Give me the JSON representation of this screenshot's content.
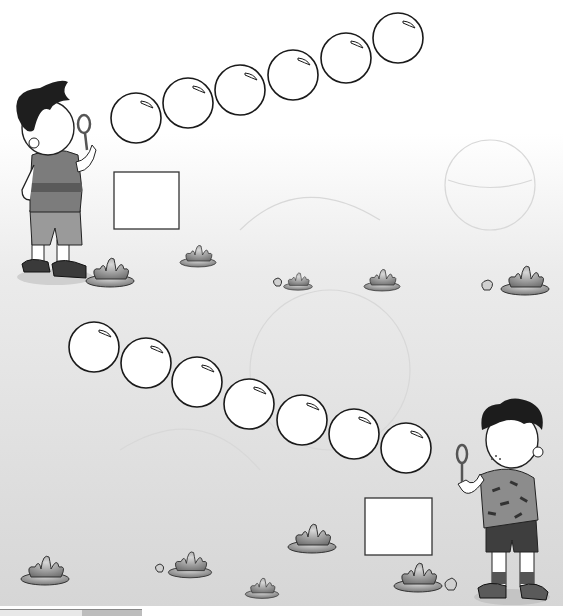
{
  "worksheet": {
    "type": "counting-bubbles-illustration",
    "colors": {
      "background_top": "#ffffff",
      "background_bottom": "#d9d9d9",
      "outline": "#1a1a1a",
      "bubble_fill": "#ffffff",
      "plant_dark": "#6e6e6e",
      "plant_light": "#c8c8c8"
    },
    "top_group": {
      "character": "boy-with-wavy-hair-blowing-bubbles",
      "bubble_count": 6,
      "bubbles": [
        {
          "cx": 136,
          "cy": 118
        },
        {
          "cx": 188,
          "cy": 103
        },
        {
          "cx": 240,
          "cy": 90
        },
        {
          "cx": 293,
          "cy": 75
        },
        {
          "cx": 346,
          "cy": 58
        },
        {
          "cx": 398,
          "cy": 38
        }
      ],
      "answer_box": {
        "x": 114,
        "y": 172,
        "w": 65,
        "h": 57,
        "value": ""
      }
    },
    "bottom_group": {
      "character": "boy-with-curly-hair-blowing-bubbles",
      "bubble_count": 7,
      "bubbles": [
        {
          "cx": 94,
          "cy": 347
        },
        {
          "cx": 146,
          "cy": 363
        },
        {
          "cx": 197,
          "cy": 382
        },
        {
          "cx": 249,
          "cy": 404
        },
        {
          "cx": 302,
          "cy": 420
        },
        {
          "cx": 354,
          "cy": 434
        },
        {
          "cx": 406,
          "cy": 448
        }
      ],
      "answer_box": {
        "x": 365,
        "y": 498,
        "w": 67,
        "h": 57,
        "value": ""
      }
    },
    "plants": [
      {
        "x": 110,
        "y": 275,
        "s": 1.0
      },
      {
        "x": 198,
        "y": 258,
        "s": 0.75
      },
      {
        "x": 298,
        "y": 283,
        "s": 0.6
      },
      {
        "x": 382,
        "y": 282,
        "s": 0.75
      },
      {
        "x": 525,
        "y": 283,
        "s": 1.0
      },
      {
        "x": 45,
        "y": 573,
        "s": 1.0
      },
      {
        "x": 190,
        "y": 567,
        "s": 0.9
      },
      {
        "x": 262,
        "y": 590,
        "s": 0.7
      },
      {
        "x": 312,
        "y": 541,
        "s": 1.0
      },
      {
        "x": 418,
        "y": 580,
        "s": 1.0
      }
    ]
  }
}
